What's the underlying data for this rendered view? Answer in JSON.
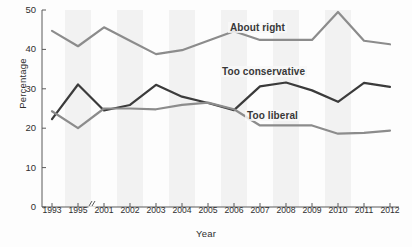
{
  "chart_data": {
    "type": "line",
    "title": "",
    "xlabel": "Year",
    "ylabel": "Percentage",
    "ylim": [
      0,
      50
    ],
    "yticks": [
      0,
      10,
      20,
      30,
      40,
      50
    ],
    "grid": false,
    "legend_position": "inline-annotations",
    "axis_break": "//",
    "axis_break_note": "x-axis break between 1995 and 2001",
    "categories": [
      "1993",
      "1995",
      "2001",
      "2002",
      "2003",
      "2004",
      "2005",
      "2006",
      "2007",
      "2008",
      "2009",
      "2010",
      "2011",
      "2012"
    ],
    "series": [
      {
        "name": "About right",
        "color": "#8c8c8c",
        "values": [
          44.7,
          40.8,
          45.6,
          42.2,
          38.8,
          39.8,
          42.2,
          44.6,
          42.4,
          42.4,
          42.4,
          49.5,
          42.2,
          41.3
        ]
      },
      {
        "name": "Too conservative",
        "color": "#3b3b3b",
        "values": [
          22.3,
          31.1,
          24.5,
          25.9,
          31.0,
          28.0,
          26.4,
          24.6,
          30.6,
          31.6,
          29.6,
          26.7,
          31.5,
          30.5
        ]
      },
      {
        "name": "Too liberal",
        "color": "#8c8c8c",
        "values": [
          24.3,
          20.0,
          25.0,
          25.0,
          24.8,
          25.9,
          26.5,
          24.8,
          20.7,
          20.7,
          20.7,
          18.6,
          18.8,
          19.4
        ]
      }
    ]
  },
  "annotations": {
    "about_right": "About right",
    "too_conservative": "Too conservative",
    "too_liberal": "Too liberal"
  },
  "axes": {
    "x_title": "Year",
    "y_title": "Percentage"
  }
}
